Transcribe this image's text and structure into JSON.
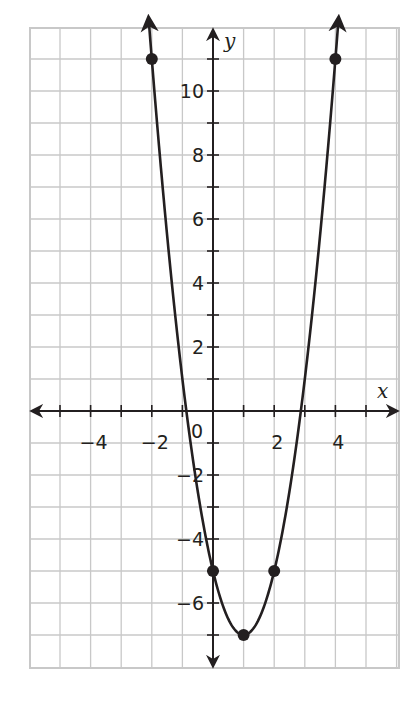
{
  "chart_data": {
    "type": "line",
    "title": "",
    "xlabel": "x",
    "ylabel": "y",
    "xlim": [
      -6,
      6
    ],
    "ylim": [
      -8,
      12
    ],
    "grid": true,
    "x_ticks": [
      -4,
      -2,
      0,
      2,
      4
    ],
    "x_tick_labels": [
      "−4",
      "−2",
      "0",
      "2",
      "4"
    ],
    "y_ticks": [
      -6,
      -4,
      -2,
      2,
      4,
      6,
      8,
      10
    ],
    "y_tick_labels": [
      "−6",
      "−4",
      "−2",
      "2",
      "4",
      "6",
      "8",
      "10"
    ],
    "series": [
      {
        "name": "y = 2x² − 4x − 5",
        "curve": "parabola",
        "equation": {
          "a": 2,
          "b": -4,
          "c": -5
        },
        "points": [
          {
            "x": -2,
            "y": 11
          },
          {
            "x": 0,
            "y": -5
          },
          {
            "x": 1,
            "y": -7
          },
          {
            "x": 2,
            "y": -5
          },
          {
            "x": 4,
            "y": 11
          }
        ],
        "vertex": {
          "x": 1,
          "y": -7
        },
        "arrows_at_ends": true
      }
    ]
  },
  "colors": {
    "grid": "#c8c8c8",
    "axis": "#231f20",
    "curve": "#231f20",
    "background": "#ffffff"
  }
}
